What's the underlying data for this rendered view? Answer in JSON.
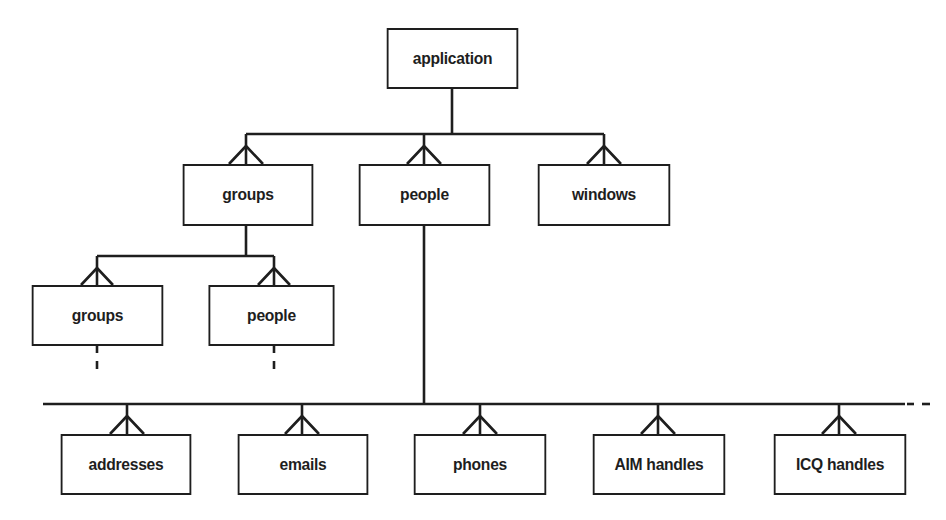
{
  "diagram": {
    "type": "entity-hierarchy",
    "notation": "crows-foot (one-to-many)",
    "nodes": [
      {
        "id": "application",
        "label": "application",
        "x": 381,
        "y": 28,
        "w": 143,
        "h": 61
      },
      {
        "id": "groups_l1",
        "label": "groups",
        "x": 177,
        "y": 164,
        "w": 142,
        "h": 62
      },
      {
        "id": "people_l1",
        "label": "people",
        "x": 353,
        "y": 164,
        "w": 143,
        "h": 62
      },
      {
        "id": "windows_l1",
        "label": "windows",
        "x": 532,
        "y": 164,
        "w": 144,
        "h": 62
      },
      {
        "id": "groups_l2",
        "label": "groups",
        "x": 26,
        "y": 285,
        "w": 143,
        "h": 61
      },
      {
        "id": "people_l2",
        "label": "people",
        "x": 203,
        "y": 285,
        "w": 137,
        "h": 61
      },
      {
        "id": "addresses",
        "label": "addresses",
        "x": 55,
        "y": 434,
        "w": 142,
        "h": 61
      },
      {
        "id": "emails",
        "label": "emails",
        "x": 232,
        "y": 434,
        "w": 142,
        "h": 61
      },
      {
        "id": "phones",
        "label": "phones",
        "x": 408,
        "y": 434,
        "w": 144,
        "h": 61
      },
      {
        "id": "aim_handles",
        "label": "AIM handles",
        "x": 587,
        "y": 434,
        "w": 144,
        "h": 61
      },
      {
        "id": "icq_handles",
        "label": "ICQ handles",
        "x": 768,
        "y": 434,
        "w": 144,
        "h": 61
      }
    ],
    "edges": [
      {
        "from": "application",
        "to": "groups_l1",
        "cardinality": "one-to-many"
      },
      {
        "from": "application",
        "to": "people_l1",
        "cardinality": "one-to-many"
      },
      {
        "from": "application",
        "to": "windows_l1",
        "cardinality": "one-to-many"
      },
      {
        "from": "groups_l1",
        "to": "groups_l2",
        "cardinality": "one-to-many"
      },
      {
        "from": "groups_l1",
        "to": "people_l2",
        "cardinality": "one-to-many"
      },
      {
        "from": "people_l1",
        "to": "addresses",
        "cardinality": "one-to-many"
      },
      {
        "from": "people_l1",
        "to": "emails",
        "cardinality": "one-to-many"
      },
      {
        "from": "people_l1",
        "to": "phones",
        "cardinality": "one-to-many"
      },
      {
        "from": "people_l1",
        "to": "aim_handles",
        "cardinality": "one-to-many"
      },
      {
        "from": "people_l1",
        "to": "icq_handles",
        "cardinality": "one-to-many"
      }
    ],
    "continuations": [
      {
        "node": "groups_l2",
        "style": "dashed",
        "direction": "down"
      },
      {
        "node": "people_l2",
        "style": "dashed",
        "direction": "down"
      },
      {
        "bus": "people_attributes",
        "style": "dashed",
        "direction": "right"
      }
    ]
  },
  "colors": {
    "stroke": "#1e1e1e",
    "background": "#ffffff",
    "text": "#1e1e1e"
  }
}
